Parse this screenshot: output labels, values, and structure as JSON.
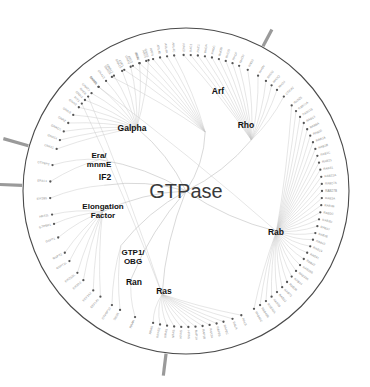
{
  "figure": {
    "type": "circular-phylogenetic-tree",
    "root_label": "GTPase",
    "background": "#ffffff",
    "circle_stroke": "#4a4a4a",
    "branch_color": "#b9b9b9",
    "leaf_label_color": "#8a8a8a",
    "clade_label_color": "#111111",
    "marker_color": "#9a9a9a",
    "center": {
      "x": 186,
      "y": 191
    },
    "radius": 163
  },
  "clades": [
    {
      "name": "Arf",
      "label": "Arf",
      "x": 218,
      "y": 94,
      "font": 8.5,
      "angle_deg": -72,
      "radius": 62
    },
    {
      "name": "Rho",
      "label": "Rho",
      "x": 246,
      "y": 128,
      "font": 8.5,
      "angle_deg": -38,
      "radius": 83
    },
    {
      "name": "Galpha",
      "label": "Galpha",
      "x": 132,
      "y": 131,
      "font": 8.5,
      "angle_deg": -128,
      "radius": 80
    },
    {
      "name": "Era/mnmE",
      "label": "Era/\nmnmE",
      "x": 99,
      "y": 158,
      "font": 8,
      "angle_deg": -160,
      "radius": 92
    },
    {
      "name": "IF2",
      "label": "IF2",
      "x": 105,
      "y": 180,
      "font": 8.5,
      "angle_deg": -176,
      "radius": 82
    },
    {
      "name": "Elongation Factor",
      "label": "Elongation\nFactor",
      "x": 103,
      "y": 209,
      "font": 8,
      "angle_deg": 166,
      "radius": 86
    },
    {
      "name": "GTP1/OBG",
      "label": "GTP1/\nOBG",
      "x": 133,
      "y": 255,
      "font": 8,
      "angle_deg": 140,
      "radius": 85
    },
    {
      "name": "Ran",
      "label": "Ran",
      "x": 134,
      "y": 285,
      "font": 8.5,
      "angle_deg": 122,
      "radius": 103
    },
    {
      "name": "Ras",
      "label": "Ras",
      "x": 164,
      "y": 294,
      "font": 8.5,
      "angle_deg": 103,
      "radius": 106
    },
    {
      "name": "Rab",
      "label": "Rab",
      "x": 276,
      "y": 235,
      "font": 8.5,
      "angle_deg": 24,
      "radius": 99
    }
  ],
  "markers": [
    {
      "name": "marker-top-right",
      "angle_deg": -62,
      "inner_r": 164,
      "outer_r": 183
    },
    {
      "name": "marker-left-upper",
      "angle_deg": 182,
      "inner_r": 164,
      "outer_r": 190
    },
    {
      "name": "marker-left-lower",
      "angle_deg": 196,
      "inner_r": 164,
      "outer_r": 190
    },
    {
      "name": "marker-bottom",
      "angle_deg": 97,
      "inner_r": 164,
      "outer_r": 186
    }
  ],
  "leaves": [
    {
      "label": "GNAS",
      "angle_deg": -106,
      "clade": "Galpha"
    },
    {
      "label": "GNAL",
      "angle_deg": -110,
      "clade": "Galpha"
    },
    {
      "label": "GNAQ",
      "angle_deg": -114,
      "clade": "Galpha"
    },
    {
      "label": "GNA15",
      "angle_deg": -118,
      "clade": "Galpha"
    },
    {
      "label": "GNA12",
      "angle_deg": -122,
      "clade": "Galpha"
    },
    {
      "label": "GNA13",
      "angle_deg": -126,
      "clade": "Galpha"
    },
    {
      "label": "GNAT1",
      "angle_deg": -130,
      "clade": "Galpha"
    },
    {
      "label": "GNAT2",
      "angle_deg": -134,
      "clade": "Galpha"
    },
    {
      "label": "GNAI1",
      "angle_deg": -138,
      "clade": "Galpha"
    },
    {
      "label": "GNAI2",
      "angle_deg": -142,
      "clade": "Galpha"
    },
    {
      "label": "GNAI3",
      "angle_deg": -146,
      "clade": "Galpha"
    },
    {
      "label": "GNAZ",
      "angle_deg": -150,
      "clade": "Galpha"
    },
    {
      "label": "GNAO1",
      "angle_deg": -154,
      "clade": "Galpha"
    },
    {
      "label": "GNA14",
      "angle_deg": -158,
      "clade": "Galpha"
    },
    {
      "label": "GNA11",
      "angle_deg": -162,
      "clade": "Galpha"
    },
    {
      "label": "GTPBP3",
      "angle_deg": -169,
      "clade": "Era/mnmE"
    },
    {
      "label": "ERAL1",
      "angle_deg": -176,
      "clade": "Era/mnmE"
    },
    {
      "label": "EIF2B5",
      "angle_deg": -183,
      "clade": "IF2"
    },
    {
      "label": "HBS1L",
      "angle_deg": -190,
      "clade": "Elongation Factor"
    },
    {
      "label": "GTPBP1",
      "angle_deg": -194,
      "clade": "Elongation Factor"
    },
    {
      "label": "GSPT1",
      "angle_deg": -200,
      "clade": "Elongation Factor"
    },
    {
      "label": "GSPT2",
      "angle_deg": -207,
      "clade": "Elongation Factor"
    },
    {
      "label": "GSPT1L",
      "angle_deg": -211,
      "clade": "Elongation Factor"
    },
    {
      "label": "EIF2S3L",
      "angle_deg": -217,
      "clade": "Elongation Factor"
    },
    {
      "label": "EIF2S3",
      "angle_deg": -221,
      "clade": "Elongation Factor"
    },
    {
      "label": "EEF1A2",
      "angle_deg": -227,
      "clade": "Elongation Factor"
    },
    {
      "label": "EEF1A1",
      "angle_deg": -231,
      "clade": "Elongation Factor"
    },
    {
      "label": "GTPBP10",
      "angle_deg": -237,
      "clade": "GTP1/OBG"
    },
    {
      "label": "DRG1",
      "angle_deg": -241,
      "clade": "GTP1/OBG"
    },
    {
      "label": "RRAN",
      "angle_deg": -248,
      "clade": "Ran"
    },
    {
      "label": "RRAS",
      "angle_deg": -256,
      "clade": "Ras"
    },
    {
      "label": "RRAS2",
      "angle_deg": -259,
      "clade": "Ras"
    },
    {
      "label": "MRAS",
      "angle_deg": -262,
      "clade": "Ras"
    },
    {
      "label": "NRAS",
      "angle_deg": -265,
      "clade": "Ras"
    },
    {
      "label": "KRAS",
      "angle_deg": -268,
      "clade": "Ras"
    },
    {
      "label": "HRAS",
      "angle_deg": -271,
      "clade": "Ras"
    },
    {
      "label": "RAP1A",
      "angle_deg": -274,
      "clade": "Ras"
    },
    {
      "label": "RAP1B",
      "angle_deg": -277,
      "clade": "Ras"
    },
    {
      "label": "RAP2A",
      "angle_deg": -280,
      "clade": "Ras"
    },
    {
      "label": "RAP2B",
      "angle_deg": -283,
      "clade": "Ras"
    },
    {
      "label": "RAP2C",
      "angle_deg": -286,
      "clade": "Ras"
    },
    {
      "label": "RALA",
      "angle_deg": -290,
      "clade": "Ras"
    },
    {
      "label": "RALB",
      "angle_deg": -294,
      "clade": "Ras"
    },
    {
      "label": "RAB40C",
      "angle_deg": -300,
      "clade": "Rab"
    },
    {
      "label": "RAB40B",
      "angle_deg": -303,
      "clade": "Rab"
    },
    {
      "label": "RAB40A",
      "angle_deg": -306,
      "clade": "Rab"
    },
    {
      "label": "RAB38",
      "angle_deg": -309,
      "clade": "Rab"
    },
    {
      "label": "RAB32",
      "angle_deg": -312,
      "clade": "Rab"
    },
    {
      "label": "RAB23",
      "angle_deg": -315,
      "clade": "Rab"
    },
    {
      "label": "RAB36",
      "angle_deg": -318,
      "clade": "Rab"
    },
    {
      "label": "RAB44",
      "angle_deg": -321,
      "clade": "Rab"
    },
    {
      "label": "RAB39A",
      "angle_deg": -324,
      "clade": "Rab"
    },
    {
      "label": "RAB39B",
      "angle_deg": -327,
      "clade": "Rab"
    },
    {
      "label": "RAB42",
      "angle_deg": -330,
      "clade": "Rab"
    },
    {
      "label": "RAB41",
      "angle_deg": -333,
      "clade": "Rab"
    },
    {
      "label": "RAB19",
      "angle_deg": -336,
      "clade": "Rab"
    },
    {
      "label": "RAB43",
      "angle_deg": -339,
      "clade": "Rab"
    },
    {
      "label": "RAB26",
      "angle_deg": -342,
      "clade": "Rab"
    },
    {
      "label": "RAB37",
      "angle_deg": -345,
      "clade": "Rab"
    },
    {
      "label": "RAB3D",
      "angle_deg": -348,
      "clade": "Rab"
    },
    {
      "label": "RAB3C",
      "angle_deg": -351,
      "clade": "Rab"
    },
    {
      "label": "RAB3B",
      "angle_deg": -354,
      "clade": "Rab"
    },
    {
      "label": "RAB3A",
      "angle_deg": -357,
      "clade": "Rab"
    },
    {
      "label": "RAB27B",
      "angle_deg": -360,
      "clade": "Rab"
    },
    {
      "label": "RAB27A",
      "angle_deg": -363,
      "clade": "Rab"
    },
    {
      "label": "RAB22A",
      "angle_deg": -366,
      "clade": "Rab"
    },
    {
      "label": "RAB31",
      "angle_deg": -369,
      "clade": "Rab"
    },
    {
      "label": "RAB21",
      "angle_deg": -372,
      "clade": "Rab"
    },
    {
      "label": "RAB1C",
      "angle_deg": -375,
      "clade": "Rab"
    },
    {
      "label": "RAB1B",
      "angle_deg": -378,
      "clade": "Rab"
    },
    {
      "label": "RAB1A",
      "angle_deg": -381,
      "clade": "Rab"
    },
    {
      "label": "RAB35",
      "angle_deg": -384,
      "clade": "Rab"
    },
    {
      "label": "RAB8A",
      "angle_deg": -387,
      "clade": "Rab"
    },
    {
      "label": "RAB13",
      "angle_deg": -390,
      "clade": "Rab"
    },
    {
      "label": "RAB11B",
      "angle_deg": -393,
      "clade": "Rab"
    },
    {
      "label": "RAB11A",
      "angle_deg": -396,
      "clade": "Rab"
    },
    {
      "label": "RAB25",
      "angle_deg": -399,
      "clade": "Rab"
    },
    {
      "label": "CDC42",
      "angle_deg": -404,
      "clade": "Rho"
    },
    {
      "label": "RHOJ",
      "angle_deg": -408,
      "clade": "Rho"
    },
    {
      "label": "RHOQ",
      "angle_deg": -411,
      "clade": "Rho"
    },
    {
      "label": "RHOU",
      "angle_deg": -414,
      "clade": "Rho"
    },
    {
      "label": "RHOV",
      "angle_deg": -418,
      "clade": "Rho"
    },
    {
      "label": "RND3",
      "angle_deg": -423,
      "clade": "Rho"
    },
    {
      "label": "RHOH",
      "angle_deg": -427,
      "clade": "Rho"
    },
    {
      "label": "RHOF",
      "angle_deg": -430,
      "clade": "Rho"
    },
    {
      "label": "RHOD",
      "angle_deg": -433,
      "clade": "Rho"
    },
    {
      "label": "RHOB",
      "angle_deg": -436,
      "clade": "Rho"
    },
    {
      "label": "RHOC",
      "angle_deg": -439,
      "clade": "Rho"
    },
    {
      "label": "RHOA",
      "angle_deg": -442,
      "clade": "Rho"
    },
    {
      "label": "RAC1",
      "angle_deg": -445,
      "clade": "Rho"
    },
    {
      "label": "RAC2",
      "angle_deg": -448,
      "clade": "Rho"
    },
    {
      "label": "RAC3",
      "angle_deg": -451,
      "clade": "Rho"
    },
    {
      "label": "ARL4C",
      "angle_deg": -455,
      "clade": "Arf"
    },
    {
      "label": "ARL4A",
      "angle_deg": -458,
      "clade": "Arf"
    },
    {
      "label": "ARL4D",
      "angle_deg": -461,
      "clade": "Arf"
    },
    {
      "label": "ARF6",
      "angle_deg": -464,
      "clade": "Arf"
    },
    {
      "label": "ARF5",
      "angle_deg": -467,
      "clade": "Arf"
    },
    {
      "label": "ARF4",
      "angle_deg": -470,
      "clade": "Arf"
    },
    {
      "label": "ARF3",
      "angle_deg": -473,
      "clade": "Arf"
    },
    {
      "label": "ARF1",
      "angle_deg": -477,
      "clade": "Arf"
    },
    {
      "label": "SAR1A",
      "angle_deg": -483,
      "clade": "Arf"
    },
    {
      "label": "RAB8B",
      "angle_deg": -490,
      "clade": "Rab"
    },
    {
      "label": "RHEB",
      "angle_deg": -496,
      "clade": "Ras"
    },
    {
      "label": "RIT1",
      "angle_deg": -500,
      "clade": "Ras"
    }
  ]
}
